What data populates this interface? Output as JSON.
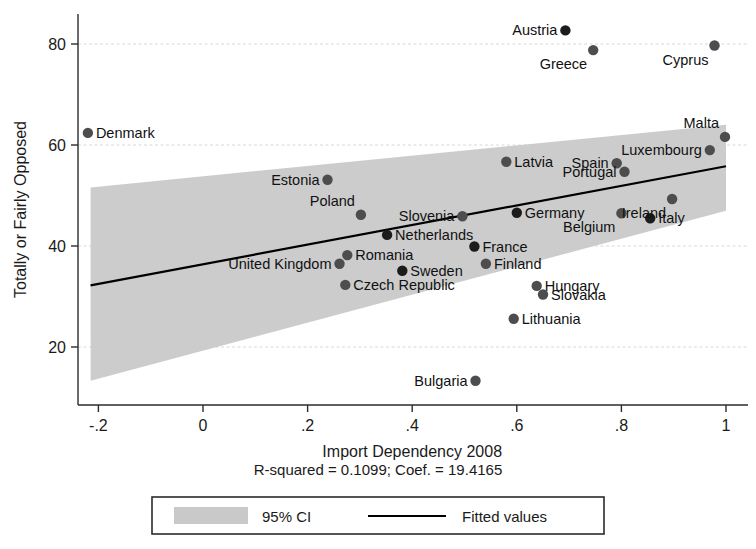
{
  "chart_data": {
    "type": "scatter",
    "title": "",
    "xlabel": "Import Dependency 2008",
    "ylabel": "Totally or Fairly Opposed",
    "xlim": [
      -0.26,
      1.03
    ],
    "ylim": [
      10,
      85
    ],
    "xticks": [
      "-.2",
      "0",
      ".2",
      ".4",
      ".6",
      ".8",
      "1"
    ],
    "xtick_values": [
      -0.2,
      0,
      0.2,
      0.4,
      0.6,
      0.8,
      1
    ],
    "yticks": [
      "20",
      "40",
      "60",
      "80"
    ],
    "ytick_values": [
      20,
      40,
      60,
      80
    ],
    "grid": "horizontal-dotted",
    "legend_position": "below-plot",
    "annotation": "R-squared = 0.1099;    Coef. = 19.4165",
    "r_squared": "0.1099",
    "coefficient": "19.4165",
    "fit": {
      "x_start": -0.215,
      "y_start": 32.2,
      "x_end": 1.0,
      "y_end": 55.8
    },
    "ci_band": {
      "x_start": -0.215,
      "upper_start": 51.6,
      "lower_start": 13.3,
      "x_end": 1.0,
      "upper_end": 64.0,
      "lower_end": 47.0
    },
    "points": [
      {
        "name": "Denmark",
        "x": -0.22,
        "y": 62.4,
        "label_side": "right",
        "dark": false
      },
      {
        "name": "Estonia",
        "x": 0.238,
        "y": 53.1,
        "label_side": "left",
        "dark": false
      },
      {
        "name": "Poland",
        "x": 0.302,
        "y": 46.2,
        "label_side": "above",
        "dark": false
      },
      {
        "name": "United Kingdom",
        "x": 0.261,
        "y": 36.5,
        "label_side": "left",
        "dark": false
      },
      {
        "name": "Romania",
        "x": 0.276,
        "y": 38.2,
        "label_side": "right",
        "dark": false
      },
      {
        "name": "Czech Republic",
        "x": 0.272,
        "y": 32.3,
        "label_side": "right",
        "dark": false
      },
      {
        "name": "Netherlands",
        "x": 0.352,
        "y": 42.2,
        "label_side": "right",
        "dark": true
      },
      {
        "name": "Sweden",
        "x": 0.381,
        "y": 35.1,
        "label_side": "right",
        "dark": true
      },
      {
        "name": "Slovenia",
        "x": 0.496,
        "y": 45.9,
        "label_side": "left",
        "dark": false
      },
      {
        "name": "France",
        "x": 0.519,
        "y": 39.9,
        "label_side": "right",
        "dark": true
      },
      {
        "name": "Finland",
        "x": 0.541,
        "y": 36.5,
        "label_side": "right",
        "dark": false
      },
      {
        "name": "Bulgaria",
        "x": 0.521,
        "y": 13.3,
        "label_side": "left",
        "dark": false
      },
      {
        "name": "Latvia",
        "x": 0.58,
        "y": 56.7,
        "label_side": "right",
        "dark": false
      },
      {
        "name": "Germany",
        "x": 0.6,
        "y": 46.6,
        "label_side": "right",
        "dark": true
      },
      {
        "name": "Lithuania",
        "x": 0.594,
        "y": 25.6,
        "label_side": "right",
        "dark": false
      },
      {
        "name": "Hungary",
        "x": 0.638,
        "y": 32.1,
        "label_side": "right",
        "dark": false
      },
      {
        "name": "Slovakia",
        "x": 0.65,
        "y": 30.4,
        "label_side": "right",
        "dark": false
      },
      {
        "name": "Greece",
        "x": 0.746,
        "y": 78.8,
        "label_side": "below",
        "dark": false
      },
      {
        "name": "Austria",
        "x": 0.693,
        "y": 82.7,
        "label_side": "left",
        "dark": true
      },
      {
        "name": "Spain",
        "x": 0.791,
        "y": 56.4,
        "label_side": "left",
        "dark": false
      },
      {
        "name": "Portugal",
        "x": 0.806,
        "y": 54.7,
        "label_side": "left",
        "dark": false
      },
      {
        "name": "Belgium",
        "x": 0.8,
        "y": 46.5,
        "label_side": "below",
        "dark": false
      },
      {
        "name": "Italy",
        "x": 0.855,
        "y": 45.5,
        "label_side": "right",
        "dark": true
      },
      {
        "name": "Ireland",
        "x": 0.897,
        "y": 49.3,
        "label_side": "below",
        "dark": false
      },
      {
        "name": "Luxembourg",
        "x": 0.969,
        "y": 59.0,
        "label_side": "left",
        "dark": false
      },
      {
        "name": "Malta",
        "x": 0.998,
        "y": 61.6,
        "label_side": "above",
        "dark": false
      },
      {
        "name": "Cyprus",
        "x": 0.978,
        "y": 79.7,
        "label_side": "below",
        "dark": false
      }
    ]
  },
  "legend": {
    "ci_label": "95% CI",
    "fit_label": "Fitted values"
  },
  "colors": {
    "ci_band": "#c9c9c9",
    "fit_line": "#000000",
    "dot": "#4d4d4d",
    "dot_dark": "#1c1c1c",
    "axis": "#2b2b2b",
    "grid": "#d8d8d8",
    "background": "#ffffff"
  }
}
